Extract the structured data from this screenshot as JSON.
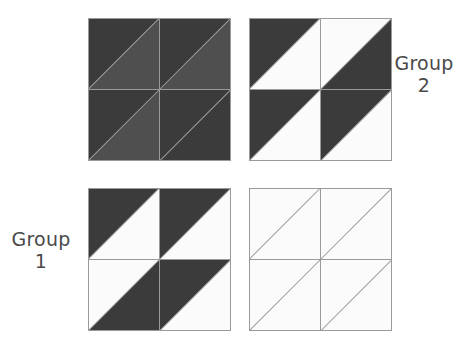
{
  "figure": {
    "name": "four-quadrant-shading-figure",
    "background": "#ffffff",
    "stroke_color": "#999999",
    "palette": {
      "dark": "#3b3b3b",
      "medium": "#4f4f4f",
      "white": "#fbfbfb",
      "outline": "#9a9a9a"
    }
  },
  "labels": {
    "group_2": "Group\n2",
    "group_1": "Group\n1"
  },
  "chart_data": {
    "type": "heatmap",
    "title": "",
    "xlabel": "",
    "ylabel": "",
    "legend_position": "none",
    "grid": false,
    "panels": [
      {
        "id": "panel-1",
        "position": "top-left",
        "x": 88,
        "y": 18,
        "size": 143,
        "cells": [
          {
            "cell": "top-left",
            "upper_left": "dark",
            "lower_right": "medium"
          },
          {
            "cell": "top-right",
            "upper_left": "dark",
            "lower_right": "medium"
          },
          {
            "cell": "bottom-left",
            "upper_left": "dark",
            "lower_right": "medium"
          },
          {
            "cell": "bottom-right",
            "upper_left": "dark",
            "lower_right": "dark"
          }
        ]
      },
      {
        "id": "panel-2",
        "position": "top-right",
        "x": 249,
        "y": 18,
        "size": 143,
        "cells": [
          {
            "cell": "top-left",
            "upper_left": "dark",
            "lower_right": "white"
          },
          {
            "cell": "top-right",
            "upper_left": "white",
            "lower_right": "dark"
          },
          {
            "cell": "bottom-left",
            "upper_left": "dark",
            "lower_right": "white"
          },
          {
            "cell": "bottom-right",
            "upper_left": "dark",
            "lower_right": "white"
          }
        ]
      },
      {
        "id": "panel-3",
        "position": "bottom-left",
        "x": 88,
        "y": 188,
        "size": 143,
        "cells": [
          {
            "cell": "top-left",
            "upper_left": "dark",
            "lower_right": "white"
          },
          {
            "cell": "top-right",
            "upper_left": "dark",
            "lower_right": "white"
          },
          {
            "cell": "bottom-left",
            "upper_left": "white",
            "lower_right": "dark"
          },
          {
            "cell": "bottom-right",
            "upper_left": "dark",
            "lower_right": "white"
          }
        ]
      },
      {
        "id": "panel-4",
        "position": "bottom-right",
        "x": 249,
        "y": 188,
        "size": 143,
        "cells": [
          {
            "cell": "top-left",
            "upper_left": "white",
            "lower_right": "white"
          },
          {
            "cell": "top-right",
            "upper_left": "white",
            "lower_right": "white"
          },
          {
            "cell": "bottom-left",
            "upper_left": "white",
            "lower_right": "white"
          },
          {
            "cell": "bottom-right",
            "upper_left": "white",
            "lower_right": "white"
          }
        ]
      }
    ]
  }
}
